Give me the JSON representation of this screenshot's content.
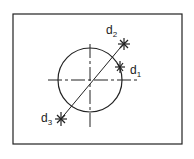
{
  "diagram": {
    "frame": {
      "x": 13,
      "y": 14,
      "width": 169,
      "height": 130
    },
    "circle": {
      "cx": 90,
      "cy": 80,
      "r": 32
    },
    "crosshair": {
      "horizontal": {
        "x1": 48,
        "x2": 138,
        "y": 80
      },
      "vertical": {
        "x": 90,
        "y1": 44,
        "y2": 127
      }
    },
    "diagonal": {
      "x1": 60,
      "y1": 120,
      "x2": 125,
      "y2": 42
    },
    "points": [
      {
        "id": "d1",
        "base": "d",
        "subscript": "1",
        "x": 120,
        "y": 67,
        "label_x": 130,
        "label_y": 74
      },
      {
        "id": "d2",
        "base": "d",
        "subscript": "2",
        "x": 124,
        "y": 44,
        "label_x": 106,
        "label_y": 34
      },
      {
        "id": "d3",
        "base": "d",
        "subscript": "3",
        "x": 61,
        "y": 119,
        "label_x": 41,
        "label_y": 122
      }
    ],
    "stroke_color": "#222222"
  }
}
